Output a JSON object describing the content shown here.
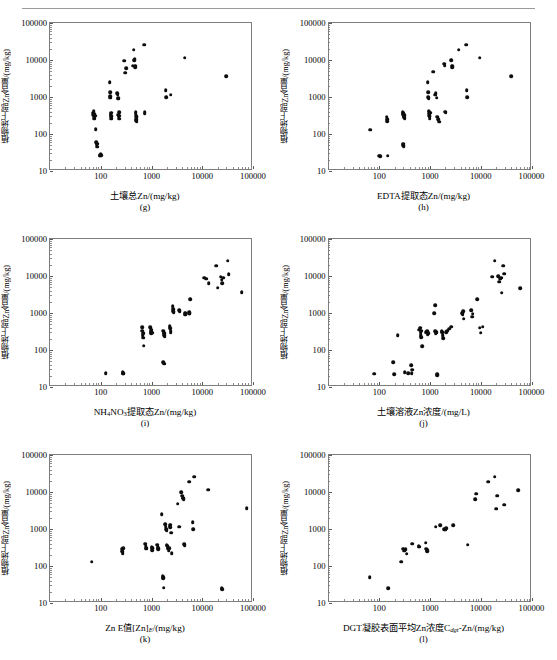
{
  "figure": {
    "ylabel": "植物地上部Zn含量/(mg/kg)",
    "y_ticks": [
      "10",
      "100",
      "1000",
      "10000",
      "100000"
    ],
    "x_ticks": [
      "100",
      "1000",
      "10000",
      "100000"
    ],
    "axis_min": 10,
    "axis_max": 100000,
    "marker_color": "#0d0d0d",
    "frame_color": "#7d7d7d"
  },
  "chart_data": [
    {
      "type": "scatter",
      "panel": "(g)",
      "title": "",
      "xlabel": "土壤总Zn/(mg/kg)",
      "ylabel": "植物地上部Zn含量/(mg/kg)",
      "xscale": "log",
      "yscale": "log",
      "xlim": [
        10,
        100000
      ],
      "ylim": [
        10,
        100000
      ],
      "grid": false,
      "legend": null,
      "points": [
        [
          70,
          380
        ],
        [
          71,
          330
        ],
        [
          72,
          420
        ],
        [
          73,
          300
        ],
        [
          74,
          260
        ],
        [
          75,
          350
        ],
        [
          76,
          290
        ],
        [
          78,
          310
        ],
        [
          80,
          135
        ],
        [
          82,
          60
        ],
        [
          83,
          52
        ],
        [
          84,
          45
        ],
        [
          86,
          55
        ],
        [
          95,
          27
        ],
        [
          97,
          26
        ],
        [
          99,
          28
        ],
        [
          101,
          27
        ],
        [
          150,
          2500
        ],
        [
          152,
          1350
        ],
        [
          153,
          1050
        ],
        [
          155,
          950
        ],
        [
          157,
          300
        ],
        [
          158,
          340
        ],
        [
          160,
          260
        ],
        [
          162,
          380
        ],
        [
          165,
          300
        ],
        [
          210,
          1250
        ],
        [
          215,
          1150
        ],
        [
          218,
          900
        ],
        [
          220,
          950
        ],
        [
          222,
          330
        ],
        [
          225,
          300
        ],
        [
          228,
          390
        ],
        [
          230,
          260
        ],
        [
          232,
          310
        ],
        [
          290,
          9500
        ],
        [
          300,
          4500
        ],
        [
          320,
          6000
        ],
        [
          430,
          7000
        ],
        [
          450,
          19000
        ],
        [
          460,
          9800
        ],
        [
          470,
          10500
        ],
        [
          475,
          7000
        ],
        [
          480,
          6500
        ],
        [
          485,
          390
        ],
        [
          490,
          350
        ],
        [
          495,
          300
        ],
        [
          500,
          230
        ],
        [
          505,
          250
        ],
        [
          510,
          215
        ],
        [
          515,
          280
        ],
        [
          720,
          26000
        ],
        [
          730,
          390
        ],
        [
          740,
          350
        ],
        [
          1900,
          1550
        ],
        [
          1950,
          1000
        ],
        [
          2400,
          1150
        ],
        [
          4500,
          11500
        ],
        [
          30000,
          3600
        ]
      ]
    },
    {
      "type": "scatter",
      "panel": "(h)",
      "title": "",
      "xlabel": "EDTA提取态Zn/(mg/kg)",
      "ylabel": "植物地上部Zn含量/(mg/kg)",
      "xscale": "log",
      "yscale": "log",
      "xlim": [
        10,
        100000
      ],
      "ylim": [
        10,
        100000
      ],
      "grid": false,
      "legend": null,
      "points": [
        [
          66,
          130
        ],
        [
          100,
          26
        ],
        [
          105,
          25
        ],
        [
          140,
          290
        ],
        [
          142,
          250
        ],
        [
          145,
          220
        ],
        [
          148,
          26
        ],
        [
          290,
          390
        ],
        [
          295,
          330
        ],
        [
          300,
          360
        ],
        [
          305,
          300
        ],
        [
          310,
          280
        ],
        [
          315,
          320
        ],
        [
          320,
          260
        ],
        [
          295,
          55
        ],
        [
          300,
          50
        ],
        [
          305,
          47
        ],
        [
          900,
          2500
        ],
        [
          920,
          1350
        ],
        [
          930,
          1000
        ],
        [
          940,
          900
        ],
        [
          950,
          430
        ],
        [
          960,
          400
        ],
        [
          970,
          350
        ],
        [
          975,
          310
        ],
        [
          980,
          290
        ],
        [
          985,
          260
        ],
        [
          990,
          300
        ],
        [
          1000,
          380
        ],
        [
          1150,
          4800
        ],
        [
          1250,
          1150
        ],
        [
          1300,
          1250
        ],
        [
          1350,
          950
        ],
        [
          1400,
          290
        ],
        [
          1450,
          250
        ],
        [
          1500,
          215
        ],
        [
          1900,
          8000
        ],
        [
          1950,
          7000
        ],
        [
          2000,
          400
        ],
        [
          2050,
          380
        ],
        [
          2600,
          10000
        ],
        [
          2700,
          7000
        ],
        [
          2750,
          6500
        ],
        [
          2800,
          6800
        ],
        [
          3700,
          19000
        ],
        [
          5200,
          26000
        ],
        [
          5300,
          1550
        ],
        [
          5400,
          1000
        ],
        [
          9500,
          11500
        ],
        [
          40000,
          3600
        ]
      ]
    },
    {
      "type": "scatter",
      "panel": "(i)",
      "title": "",
      "xlabel": "NH4NO3提取态Zn/(mg/kg)",
      "ylabel": "植物地上部Zn含量/(mg/kg)",
      "xscale": "log",
      "yscale": "log",
      "xlim": [
        10,
        100000
      ],
      "ylim": [
        10,
        100000
      ],
      "grid": false,
      "legend": null,
      "points": [
        [
          125,
          24
        ],
        [
          270,
          25
        ],
        [
          275,
          23
        ],
        [
          280,
          24
        ],
        [
          650,
          420
        ],
        [
          660,
          330
        ],
        [
          670,
          250
        ],
        [
          680,
          215
        ],
        [
          690,
          280
        ],
        [
          700,
          130
        ],
        [
          950,
          420
        ],
        [
          960,
          380
        ],
        [
          970,
          330
        ],
        [
          980,
          300
        ],
        [
          990,
          280
        ],
        [
          1000,
          310
        ],
        [
          1010,
          350
        ],
        [
          1020,
          290
        ],
        [
          1700,
          330
        ],
        [
          1750,
          300
        ],
        [
          1780,
          280
        ],
        [
          1800,
          250
        ],
        [
          1820,
          230
        ],
        [
          1700,
          47
        ],
        [
          1750,
          45
        ],
        [
          1780,
          43
        ],
        [
          2300,
          440
        ],
        [
          2350,
          390
        ],
        [
          2380,
          330
        ],
        [
          2400,
          300
        ],
        [
          2600,
          1500
        ],
        [
          2650,
          1100
        ],
        [
          2700,
          1250
        ],
        [
          2750,
          1050
        ],
        [
          3500,
          1200
        ],
        [
          3600,
          1100
        ],
        [
          4500,
          1000
        ],
        [
          4600,
          900
        ],
        [
          4700,
          1000
        ],
        [
          5500,
          1050
        ],
        [
          5600,
          950
        ],
        [
          5700,
          1000
        ],
        [
          5800,
          2400
        ],
        [
          11000,
          9000
        ],
        [
          12000,
          8500
        ],
        [
          13500,
          6500
        ],
        [
          19000,
          19000
        ],
        [
          20000,
          4800
        ],
        [
          23000,
          9500
        ],
        [
          24000,
          8000
        ],
        [
          25000,
          6500
        ],
        [
          26000,
          9000
        ],
        [
          32000,
          26000
        ],
        [
          33000,
          11000
        ],
        [
          60000,
          3600
        ]
      ]
    },
    {
      "type": "scatter",
      "panel": "(j)",
      "title": "",
      "xlabel": "土壤溶液Zn浓度/(mg/L)",
      "ylabel": "植物地上部Zn含量/(mg/kg)",
      "xscale": "log",
      "yscale": "log",
      "xlim": [
        10,
        100000
      ],
      "ylim": [
        10,
        100000
      ],
      "grid": false,
      "legend": null,
      "points": [
        [
          80,
          23
        ],
        [
          190,
          46
        ],
        [
          195,
          22
        ],
        [
          230,
          250
        ],
        [
          320,
          25
        ],
        [
          370,
          24
        ],
        [
          430,
          39
        ],
        [
          440,
          24
        ],
        [
          450,
          29
        ],
        [
          620,
          350
        ],
        [
          640,
          400
        ],
        [
          650,
          300
        ],
        [
          660,
          250
        ],
        [
          670,
          220
        ],
        [
          680,
          330
        ],
        [
          700,
          125
        ],
        [
          850,
          300
        ],
        [
          880,
          320
        ],
        [
          900,
          270
        ],
        [
          920,
          280
        ],
        [
          1200,
          1000
        ],
        [
          1250,
          1600
        ],
        [
          1280,
          320
        ],
        [
          1300,
          280
        ],
        [
          1350,
          300
        ],
        [
          1380,
          21
        ],
        [
          1400,
          22
        ],
        [
          1700,
          320
        ],
        [
          1750,
          300
        ],
        [
          1780,
          250
        ],
        [
          1800,
          210
        ],
        [
          2100,
          300
        ],
        [
          2200,
          330
        ],
        [
          2400,
          380
        ],
        [
          2600,
          430
        ],
        [
          4300,
          1000
        ],
        [
          4400,
          900
        ],
        [
          4500,
          1100
        ],
        [
          4600,
          700
        ],
        [
          6500,
          1200
        ],
        [
          6700,
          800
        ],
        [
          6900,
          950
        ],
        [
          8500,
          2400
        ],
        [
          9500,
          400
        ],
        [
          10000,
          290
        ],
        [
          11000,
          430
        ],
        [
          17000,
          9500
        ],
        [
          19000,
          26000
        ],
        [
          22000,
          10000
        ],
        [
          23000,
          7000
        ],
        [
          24000,
          8500
        ],
        [
          25000,
          9000
        ],
        [
          26000,
          3500
        ],
        [
          28000,
          19000
        ],
        [
          29000,
          11500
        ],
        [
          60000,
          4600
        ]
      ]
    },
    {
      "type": "scatter",
      "panel": "(k)",
      "title": "",
      "xlabel": "Zn E值[Zn]E/(mg/kg)",
      "ylabel": "植物地上部Zn含量/(mg/kg)",
      "xscale": "log",
      "yscale": "log",
      "xlim": [
        10,
        100000
      ],
      "ylim": [
        10,
        100000
      ],
      "grid": false,
      "legend": null,
      "points": [
        [
          66,
          130
        ],
        [
          260,
          290
        ],
        [
          265,
          250
        ],
        [
          270,
          220
        ],
        [
          275,
          300
        ],
        [
          760,
          400
        ],
        [
          770,
          350
        ],
        [
          780,
          310
        ],
        [
          790,
          290
        ],
        [
          1000,
          330
        ],
        [
          1020,
          300
        ],
        [
          1040,
          270
        ],
        [
          1060,
          300
        ],
        [
          1300,
          380
        ],
        [
          1320,
          330
        ],
        [
          1340,
          300
        ],
        [
          1360,
          280
        ],
        [
          1600,
          2500
        ],
        [
          1650,
          55
        ],
        [
          1680,
          50
        ],
        [
          1700,
          47
        ],
        [
          1750,
          26
        ],
        [
          1850,
          1350
        ],
        [
          1900,
          1150
        ],
        [
          1950,
          1000
        ],
        [
          1980,
          900
        ],
        [
          2000,
          380
        ],
        [
          2050,
          350
        ],
        [
          2100,
          320
        ],
        [
          2150,
          290
        ],
        [
          2200,
          260
        ],
        [
          2250,
          300
        ],
        [
          2300,
          1250
        ],
        [
          2350,
          1100
        ],
        [
          2400,
          1300
        ],
        [
          2450,
          800
        ],
        [
          2500,
          220
        ],
        [
          3300,
          4800
        ],
        [
          3500,
          1150
        ],
        [
          3900,
          10000
        ],
        [
          4000,
          8000
        ],
        [
          4100,
          7000
        ],
        [
          4200,
          6800
        ],
        [
          4300,
          6500
        ],
        [
          4400,
          390
        ],
        [
          4500,
          350
        ],
        [
          5500,
          19000
        ],
        [
          7000,
          26000
        ],
        [
          6500,
          1550
        ],
        [
          6700,
          1000
        ],
        [
          13000,
          11500
        ],
        [
          24000,
          25
        ],
        [
          25000,
          24
        ],
        [
          75000,
          3600
        ]
      ]
    },
    {
      "type": "scatter",
      "panel": "(l)",
      "title": "",
      "xlabel": "DGT凝胶表面平均Zn浓度Cdgt-Zn/(mg/kg)",
      "ylabel": "植物地上部Zn含量/(mg/kg)",
      "xscale": "log",
      "yscale": "log",
      "xlim": [
        10,
        100000
      ],
      "ylim": [
        10,
        100000
      ],
      "grid": false,
      "legend": null,
      "points": [
        [
          65,
          50
        ],
        [
          150,
          25
        ],
        [
          270,
          130
        ],
        [
          300,
          290
        ],
        [
          310,
          260
        ],
        [
          330,
          280
        ],
        [
          350,
          215
        ],
        [
          450,
          400
        ],
        [
          600,
          340
        ],
        [
          620,
          330
        ],
        [
          830,
          430
        ],
        [
          850,
          290
        ],
        [
          870,
          250
        ],
        [
          890,
          270
        ],
        [
          1300,
          1150
        ],
        [
          1600,
          1250
        ],
        [
          1900,
          1000
        ],
        [
          2000,
          950
        ],
        [
          2100,
          1050
        ],
        [
          2900,
          1250
        ],
        [
          5500,
          380
        ],
        [
          7800,
          6500
        ],
        [
          8200,
          9000
        ],
        [
          14000,
          19000
        ],
        [
          19000,
          26000
        ],
        [
          20000,
          3500
        ],
        [
          21000,
          8000
        ],
        [
          29000,
          4500
        ],
        [
          55000,
          11000
        ]
      ]
    }
  ]
}
